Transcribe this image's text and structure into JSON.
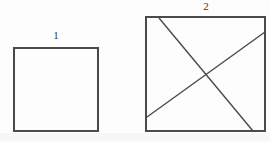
{
  "figure": {
    "canvas": {
      "width": 270,
      "height": 142,
      "background_color": "#fdfdfd"
    },
    "stroke": {
      "color": "#4a4a4a",
      "dark_color": "#3a3a3a",
      "width": 1.4
    },
    "shapes": [
      {
        "id": "square-1",
        "type": "square",
        "label": "1",
        "label_position": "above-center",
        "x": 14,
        "y": 48,
        "width": 84,
        "height": 83,
        "fill": "none",
        "interior_lines": 0
      },
      {
        "id": "square-2",
        "type": "square",
        "label": "2",
        "label_position": "above-center",
        "x": 146,
        "y": 17,
        "width": 119,
        "height": 114,
        "fill": "none",
        "interior_lines": 2,
        "lines": [
          {
            "id": "diagonal-descending",
            "x1": 159,
            "y1": 18,
            "x2": 253,
            "y2": 131
          },
          {
            "id": "diagonal-ascending",
            "x1": 147,
            "y1": 117,
            "x2": 265,
            "y2": 32
          }
        ],
        "intersection": {
          "x": 205,
          "y": 73
        }
      }
    ],
    "labels": {
      "square_1": "1",
      "square_2": "2"
    }
  }
}
